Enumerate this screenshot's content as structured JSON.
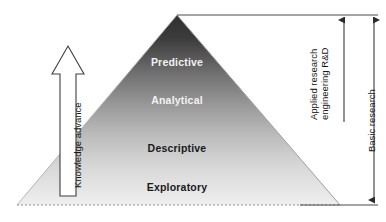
{
  "figure": {
    "title_present": false,
    "pyramid": {
      "name": "research-pyramid",
      "apex": {
        "x": 177,
        "y": 15
      },
      "base_left": {
        "x": 17,
        "y": 205
      },
      "base_right": {
        "x": 340,
        "y": 205
      },
      "gradient_top_color": "#343434",
      "gradient_bottom_color": "#ededed",
      "base_line_style": "dotted",
      "tiers": [
        {
          "id": "predictive",
          "label": "Predictive",
          "text_color": "#f2f2f2",
          "cx": 177,
          "cy": 62
        },
        {
          "id": "analytical",
          "label": "Analytical",
          "text_color": "#f2f2f2",
          "cx": 177,
          "cy": 100
        },
        {
          "id": "descriptive",
          "label": "Descriptive",
          "text_color": "#1a1a1a",
          "cx": 177,
          "cy": 148
        },
        {
          "id": "exploratory",
          "label": "Exploratory",
          "text_color": "#1a1a1a",
          "cx": 177,
          "cy": 187
        }
      ]
    },
    "left_arrow": {
      "name": "knowledge-advance-arrow",
      "label": "Knowledge advance",
      "direction": "up",
      "fill": "#ffffff",
      "stroke": "#3a3a3a"
    },
    "right_brackets": [
      {
        "id": "applied-research",
        "label_line_1": "Applied research",
        "label_line_2": "engineering R&D",
        "arrow_head": "top",
        "top_y": 15,
        "bottom_y": 122,
        "x": 344
      },
      {
        "id": "basic-research",
        "label_line_1": "Basic research",
        "label_line_2": "",
        "arrow_head": "both",
        "top_y": 15,
        "bottom_y": 205,
        "x": 374
      }
    ],
    "connector_lines": {
      "top_rule_label": "apex-to-right-rule",
      "bottom_rule_label": "base-to-right-rule"
    },
    "colors": {
      "line": "#4a4a4a",
      "light_line": "#9a9a9a",
      "background": "#ffffff"
    }
  }
}
